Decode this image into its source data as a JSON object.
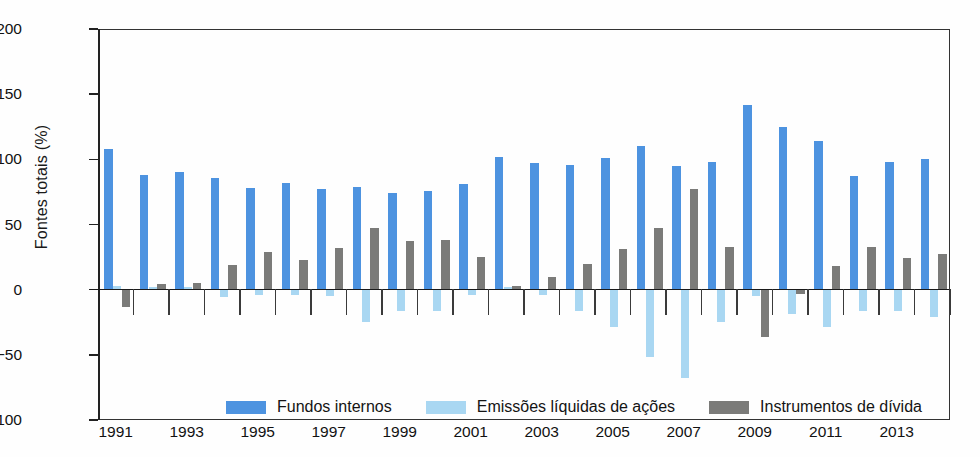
{
  "chart_data": {
    "type": "bar",
    "title": "",
    "xlabel": "",
    "ylabel": "Fontes totais (%)",
    "ylim": [
      -100,
      200
    ],
    "yticks": [
      200,
      150,
      100,
      50,
      0,
      -50,
      -100
    ],
    "ytick_labels": [
      "200",
      "150",
      "100",
      "50",
      "0",
      "−50",
      "−100"
    ],
    "grid": false,
    "legend_position": "bottom-inside",
    "categories": [
      "1991",
      "1992",
      "1993",
      "1994",
      "1995",
      "1996",
      "1997",
      "1998",
      "1999",
      "2000",
      "2001",
      "2002",
      "2003",
      "2004",
      "2005",
      "2006",
      "2007",
      "2008",
      "2009",
      "2010",
      "2011",
      "2012",
      "2013",
      "2014"
    ],
    "xtick_labels": [
      "1991",
      "1993",
      "1995",
      "1997",
      "1999",
      "2001",
      "2003",
      "2005",
      "2007",
      "2009",
      "2011",
      "2013"
    ],
    "xtick_categories": [
      "1991",
      "1993",
      "1995",
      "1997",
      "1999",
      "2001",
      "2003",
      "2005",
      "2007",
      "2009",
      "2011",
      "2013"
    ],
    "series": [
      {
        "name": "Fundos internos",
        "color": "#4d93e0",
        "values": [
          108,
          88,
          90,
          86,
          78,
          82,
          77,
          79,
          74,
          76,
          81,
          102,
          97,
          96,
          101,
          110,
          95,
          98,
          142,
          125,
          114,
          87,
          98,
          100
        ]
      },
      {
        "name": "Emissões líquidas de ações",
        "color": "#a9d7f2",
        "values": [
          3,
          2,
          2,
          -6,
          -4,
          -4,
          -5,
          -25,
          -16,
          -16,
          -4,
          2,
          -4,
          -16,
          -29,
          -52,
          -68,
          -25,
          -5,
          -19,
          -29,
          -16,
          -16,
          -21
        ]
      },
      {
        "name": "Instrumentos de dívida",
        "color": "#7b7b79",
        "values": [
          -13,
          4,
          5,
          19,
          29,
          23,
          32,
          47,
          37,
          38,
          25,
          3,
          10,
          20,
          31,
          47,
          77,
          33,
          -36,
          -3,
          18,
          33,
          24,
          27
        ]
      }
    ]
  },
  "legend": {
    "items": [
      {
        "label": "Fundos internos",
        "swatch": "series-0-swatch"
      },
      {
        "label": "Emissões líquidas de ações",
        "swatch": "series-1-swatch"
      },
      {
        "label": "Instrumentos de dívida",
        "swatch": "series-2-swatch"
      }
    ]
  }
}
